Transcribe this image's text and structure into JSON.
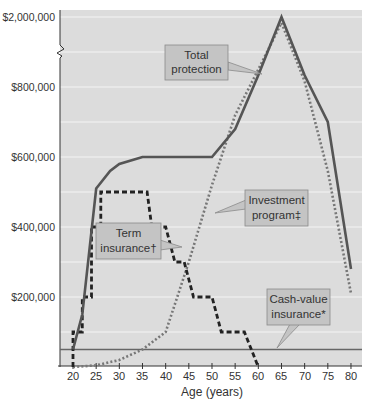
{
  "chart_data": {
    "type": "line",
    "title": "",
    "xlabel": "Age (years)",
    "ylabel": "",
    "x_ticks": [
      20,
      25,
      30,
      35,
      40,
      45,
      50,
      55,
      60,
      65,
      70,
      75,
      80
    ],
    "y_tick_labels": [
      "$2,000,000",
      "$800,000",
      "$600,000",
      "$400,000",
      "$200,000"
    ],
    "y_axis_break": true,
    "xlim": [
      18,
      82
    ],
    "ylim": [
      0,
      2000000
    ],
    "grid": true,
    "legend": "callouts",
    "series": [
      {
        "name": "Total protection",
        "style": "solid",
        "color": "#555555",
        "points": [
          [
            20,
            50000
          ],
          [
            22,
            150000
          ],
          [
            25,
            510000
          ],
          [
            28,
            560000
          ],
          [
            30,
            580000
          ],
          [
            35,
            600000
          ],
          [
            40,
            600000
          ],
          [
            45,
            600000
          ],
          [
            50,
            600000
          ],
          [
            55,
            680000
          ],
          [
            60,
            1000000
          ],
          [
            65,
            2000000
          ],
          [
            70,
            1000000
          ],
          [
            75,
            700000
          ],
          [
            80,
            280000
          ]
        ]
      },
      {
        "name": "Investment program‡",
        "style": "dotted",
        "color": "#777777",
        "points": [
          [
            20,
            0
          ],
          [
            25,
            5000
          ],
          [
            30,
            20000
          ],
          [
            35,
            50000
          ],
          [
            40,
            100000
          ],
          [
            45,
            300000
          ],
          [
            50,
            520000
          ],
          [
            55,
            720000
          ],
          [
            60,
            1100000
          ],
          [
            65,
            1900000
          ],
          [
            70,
            900000
          ],
          [
            75,
            560000
          ],
          [
            80,
            210000
          ]
        ]
      },
      {
        "name": "Term insurance†",
        "style": "dashed",
        "color": "#222222",
        "points": [
          [
            20,
            0
          ],
          [
            20,
            100000
          ],
          [
            22,
            100000
          ],
          [
            22,
            200000
          ],
          [
            24,
            200000
          ],
          [
            24,
            400000
          ],
          [
            26,
            400000
          ],
          [
            26,
            500000
          ],
          [
            36,
            500000
          ],
          [
            37,
            400000
          ],
          [
            40,
            400000
          ],
          [
            42,
            300000
          ],
          [
            44,
            300000
          ],
          [
            46,
            200000
          ],
          [
            50,
            200000
          ],
          [
            52,
            100000
          ],
          [
            57,
            100000
          ],
          [
            60,
            0
          ]
        ]
      },
      {
        "name": "Cash-value insurance*",
        "style": "solid",
        "color": "#666666",
        "points": [
          [
            18,
            50000
          ],
          [
            82,
            50000
          ]
        ]
      }
    ],
    "annotations": [
      {
        "text": [
          "Total",
          "protection"
        ],
        "points_to": [
          62,
          1100000
        ]
      },
      {
        "text": [
          "Investment",
          "program‡"
        ],
        "points_to": [
          50,
          500000
        ]
      },
      {
        "text": [
          "Term",
          "insurance†"
        ],
        "points_to": [
          43,
          300000
        ]
      },
      {
        "text": [
          "Cash-value",
          "insurance*"
        ],
        "points_to": [
          64,
          50000
        ]
      }
    ]
  },
  "labels": {
    "y": [
      "$2,000,000",
      "$800,000",
      "$600,000",
      "$400,000",
      "$200,000"
    ],
    "x": [
      "20",
      "25",
      "30",
      "35",
      "40",
      "45",
      "50",
      "55",
      "60",
      "65",
      "70",
      "75",
      "80"
    ],
    "x_title": "Age (years)",
    "callouts": {
      "total": [
        "Total",
        "protection"
      ],
      "investment": [
        "Investment",
        "program‡"
      ],
      "term": [
        "Term",
        "insurance†"
      ],
      "cash": [
        "Cash-value",
        "insurance*"
      ]
    }
  },
  "colors": {
    "plot_bg": "#dcdcdc",
    "grid": "#f4f4f4",
    "callout_bg": "#c4c4c4",
    "callout_border": "#8a8a8a",
    "total_line": "#555555",
    "investment_line": "#7a7a7a",
    "term_line": "#1e1e1e",
    "cash_line": "#6a6a6a"
  }
}
